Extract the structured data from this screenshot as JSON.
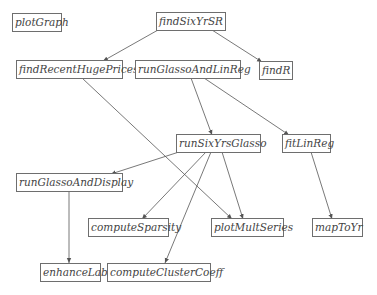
{
  "diagram": {
    "type": "call-graph",
    "nodes": [
      {
        "id": "plotGraph",
        "label": "plotGraph"
      },
      {
        "id": "findSixYrSR",
        "label": "findSixYrSR"
      },
      {
        "id": "findRecentHugePrices",
        "label": "findRecentHugePrices"
      },
      {
        "id": "runGlassoAndLinReg",
        "label": "runGlassoAndLinReg"
      },
      {
        "id": "findR",
        "label": "findR"
      },
      {
        "id": "runSixYrsGlasso",
        "label": "runSixYrsGlasso"
      },
      {
        "id": "fitLinReg",
        "label": "fitLinReg"
      },
      {
        "id": "runGlassoAndDisplay",
        "label": "runGlassoAndDisplay"
      },
      {
        "id": "computeSparsity",
        "label": "computeSparsity"
      },
      {
        "id": "plotMultSeries",
        "label": "plotMultSeries"
      },
      {
        "id": "mapToYr",
        "label": "mapToYr"
      },
      {
        "id": "enhanceLab",
        "label": "enhanceLab"
      },
      {
        "id": "computeClusterCoeff",
        "label": "computeClusterCoeff"
      }
    ],
    "edges": [
      {
        "from": "findSixYrSR",
        "to": "findRecentHugePrices"
      },
      {
        "from": "findSixYrSR",
        "to": "findR"
      },
      {
        "from": "findRecentHugePrices",
        "to": "plotMultSeries"
      },
      {
        "from": "runGlassoAndLinReg",
        "to": "runSixYrsGlasso"
      },
      {
        "from": "runGlassoAndLinReg",
        "to": "fitLinReg"
      },
      {
        "from": "runSixYrsGlasso",
        "to": "runGlassoAndDisplay"
      },
      {
        "from": "runSixYrsGlasso",
        "to": "computeSparsity"
      },
      {
        "from": "runSixYrsGlasso",
        "to": "computeClusterCoeff"
      },
      {
        "from": "runSixYrsGlasso",
        "to": "plotMultSeries"
      },
      {
        "from": "fitLinReg",
        "to": "mapToYr"
      },
      {
        "from": "runGlassoAndDisplay",
        "to": "enhanceLab"
      }
    ]
  }
}
